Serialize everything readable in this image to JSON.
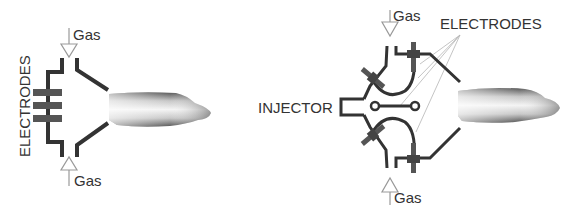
{
  "diagrams": [
    {
      "id": "left",
      "labels": {
        "gas_top": "Gas",
        "gas_bottom": "Gas",
        "electrodes": "ELECTRODES"
      }
    },
    {
      "id": "right",
      "labels": {
        "gas_top": "Gas",
        "gas_bottom": "Gas",
        "electrodes": "ELECTRODES",
        "injector": "INJECTOR"
      }
    }
  ],
  "colors": {
    "line": "#333333",
    "electrode": "#555555",
    "arrow": "#999999",
    "leader": "#b0b0b0"
  }
}
